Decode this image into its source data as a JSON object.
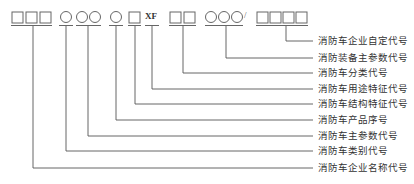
{
  "diagram": {
    "code_segments": [
      {
        "symbol": "□□□",
        "type": "squares",
        "count": 3,
        "meaning": "消防车企业名称代号"
      },
      {
        "symbol": "○",
        "type": "circles",
        "count": 1,
        "meaning": "消防车类别代号"
      },
      {
        "symbol": "○○",
        "type": "circles",
        "count": 2,
        "meaning": "消防车主参数代号"
      },
      {
        "symbol": "○",
        "type": "circles",
        "count": 1,
        "meaning": "消防车产品序号"
      },
      {
        "symbol": "□",
        "type": "squares",
        "count": 1,
        "meaning": "消防车结构特征代号"
      },
      {
        "symbol": "XF",
        "type": "text",
        "meaning": "消防车用途特征代号"
      },
      {
        "symbol": "□□",
        "type": "squares",
        "count": 2,
        "meaning": "消防车分类代号"
      },
      {
        "symbol": "○○○",
        "type": "circles",
        "count": 3,
        "meaning": "消防装备主参数代号"
      },
      {
        "symbol": "/",
        "type": "separator"
      },
      {
        "symbol": "□□□□",
        "type": "squares",
        "count": 4,
        "meaning": "消防车企业自定代号"
      }
    ],
    "xf_text": "XF",
    "slash_text": "/",
    "labels": [
      "消防车企业自定代号",
      "消防装备主参数代号",
      "消防车分类代号",
      "消防车用途特征代号",
      "消防车结构特征代号",
      "消防车产品序号",
      "消防车主参数代号",
      "消防车类别代号",
      "消防车企业名称代号"
    ],
    "line_color": "#555555",
    "symbol_color": "#666666"
  }
}
